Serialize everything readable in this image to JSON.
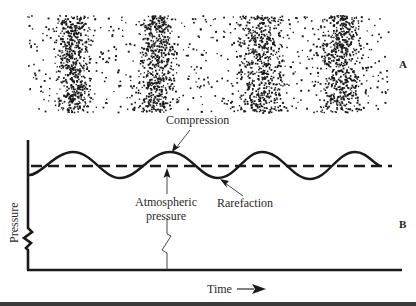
{
  "figure": {
    "panel_a": {
      "label": "A",
      "description": "Air particle density showing alternating compressions and rarefactions",
      "region": {
        "x0": 27,
        "x1": 388,
        "y0": 15,
        "y1": 112
      },
      "dense_bands_x": [
        [
          58,
          88
        ],
        [
          142,
          172
        ],
        [
          238,
          282
        ],
        [
          322,
          360
        ]
      ]
    },
    "panel_b": {
      "label": "B",
      "y_axis_label": "Pressure",
      "x_axis_label": "Time",
      "x_axis_arrow": "→",
      "annotations": {
        "compression": "Compression",
        "rarefaction": "Rarefaction",
        "atmospheric_line1": "Atmospheric",
        "atmospheric_line2": "pressure"
      },
      "baseline_y": 166,
      "wave_points": [
        [
          30,
          175
        ],
        [
          73,
          152
        ],
        [
          120,
          178
        ],
        [
          170,
          152
        ],
        [
          218,
          178
        ],
        [
          262,
          152
        ],
        [
          310,
          179
        ],
        [
          355,
          152
        ],
        [
          378,
          166
        ]
      ]
    }
  },
  "colors": {
    "ink": "#1a1a1a",
    "background": "#ffffff",
    "rule": "#3a3a3a"
  }
}
